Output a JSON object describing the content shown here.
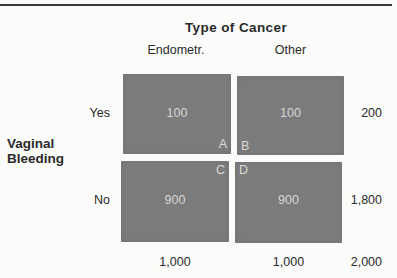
{
  "figure": {
    "title": "Type of Cancer",
    "row_axis_label_line1": "Vaginal",
    "row_axis_label_line2": "Bleeding",
    "columns": [
      {
        "label": "Endometr."
      },
      {
        "label": "Other"
      }
    ],
    "rows": [
      {
        "label": "Yes"
      },
      {
        "label": "No"
      }
    ],
    "cells": [
      {
        "id": "A",
        "value": "100",
        "row": "Yes",
        "col": "Endometr."
      },
      {
        "id": "B",
        "value": "100",
        "row": "Yes",
        "col": "Other"
      },
      {
        "id": "C",
        "value": "900",
        "row": "No",
        "col": "Endometr."
      },
      {
        "id": "D",
        "value": "900",
        "row": "No",
        "col": "Other"
      }
    ],
    "row_totals": [
      "200",
      "1,800"
    ],
    "col_totals": [
      "1,000",
      "1,000"
    ],
    "grand_total": "2,000",
    "colors": {
      "cell_fill": "#7b7b7b",
      "cell_text": "#d6d6d6",
      "text": "#2a2a2a",
      "rule": "#3a3a3a",
      "background": "#fbfbfa"
    }
  }
}
